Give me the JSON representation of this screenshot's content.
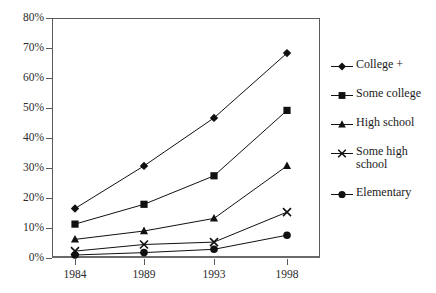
{
  "chart_data": {
    "type": "line",
    "title": "",
    "subtitle": "",
    "xlabel": "",
    "ylabel": "",
    "categories": [
      "1984",
      "1989",
      "1993",
      "1998"
    ],
    "x_tick_labels": [
      "1984",
      "1989",
      "1993",
      "1998"
    ],
    "y_tick_labels": [
      "0%",
      "10%",
      "20%",
      "30%",
      "40%",
      "50%",
      "60%",
      "70%",
      "80%"
    ],
    "y_tick_values": [
      0,
      10,
      20,
      30,
      40,
      50,
      60,
      70,
      80
    ],
    "ylim": [
      0,
      80
    ],
    "grid": false,
    "legend_position": "right",
    "series": [
      {
        "name": "College +",
        "marker": "diamond",
        "color": "#111111",
        "values": [
          16.5,
          30.7,
          46.7,
          68.3
        ]
      },
      {
        "name": "Some college",
        "marker": "square",
        "color": "#111111",
        "values": [
          11.3,
          17.9,
          27.4,
          49.2
        ]
      },
      {
        "name": "High school",
        "marker": "triangle",
        "color": "#111111",
        "values": [
          6.2,
          9.0,
          13.2,
          30.7
        ]
      },
      {
        "name": "Some high school",
        "marker": "x",
        "color": "#111111",
        "values": [
          2.3,
          4.5,
          5.3,
          15.3
        ]
      },
      {
        "name": "Elementary",
        "marker": "circle",
        "color": "#111111",
        "values": [
          1.0,
          1.8,
          2.9,
          7.6
        ]
      }
    ]
  },
  "legend": {
    "items": [
      {
        "label": "College +",
        "marker": "diamond"
      },
      {
        "label": "Some college",
        "marker": "square"
      },
      {
        "label": "High school",
        "marker": "triangle"
      },
      {
        "label": "Some high\nschool",
        "marker": "x"
      },
      {
        "label": "Elementary",
        "marker": "circle"
      }
    ]
  },
  "axes": {
    "y_labels": [
      "80%",
      "70%",
      "60%",
      "50%",
      "40%",
      "30%",
      "20%",
      "10%",
      "0%"
    ],
    "x_labels": [
      "1984",
      "1989",
      "1993",
      "1998"
    ]
  },
  "colors": {
    "ink": "#111111",
    "axis": "#5a5a5a",
    "background": "#ffffff"
  }
}
